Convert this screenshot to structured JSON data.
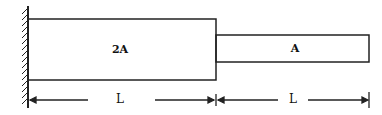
{
  "diagram": {
    "segments": [
      {
        "area_label": "2A",
        "length_label": "L"
      },
      {
        "area_label": "A",
        "length_label": "L"
      }
    ],
    "support": "fixed-wall"
  }
}
